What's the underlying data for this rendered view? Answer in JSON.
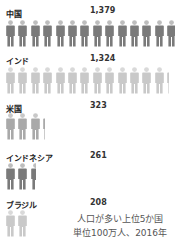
{
  "chart_data": {
    "type": "pictogram",
    "title": "人口が多い上位5か国",
    "subtitle": "単位100万人、2016年",
    "unit": "million people",
    "icon_unit": 100,
    "categories": [
      "中国",
      "インド",
      "米国",
      "インドネシア",
      "ブラジル"
    ],
    "values": [
      1379,
      1324,
      323,
      261,
      208
    ],
    "value_labels": [
      "1,379",
      "1,324",
      "323",
      "261",
      "208"
    ],
    "icon_colors": [
      "#7a7a7a",
      "#c9c9c9",
      "#a9a9a9",
      "#7a7a7a",
      "#c9c9c9"
    ]
  },
  "rows": [
    {
      "label": "中国",
      "value": "1,379",
      "icons": 13.79,
      "color": "#7a7a7a",
      "head": "#bdbdbd"
    },
    {
      "label": "インド",
      "value": "1,324",
      "icons": 13.24,
      "color": "#c9c9c9",
      "head": "#d9d9d9"
    },
    {
      "label": "米国",
      "value": "323",
      "icons": 3.23,
      "color": "#a9a9a9",
      "head": "#c8c8c8"
    },
    {
      "label": "インドネシア",
      "value": "261",
      "icons": 2.61,
      "color": "#7a7a7a",
      "head": "#bdbdbd"
    },
    {
      "label": "ブラジル",
      "value": "208",
      "icons": 2.08,
      "color": "#c9c9c9",
      "head": "#d9d9d9"
    }
  ],
  "caption": {
    "line1": "人口が多い上位5か国",
    "line2": "単位100万人、2016年"
  }
}
